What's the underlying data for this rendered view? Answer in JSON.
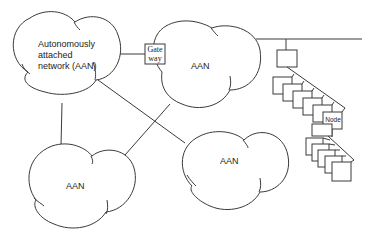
{
  "diagram": {
    "type": "network-topology",
    "networks": [
      {
        "id": "aan-main",
        "label_lines": [
          "Autonomously",
          "attached",
          "network (AAN)"
        ]
      },
      {
        "id": "aan-top-right",
        "label": "AAN"
      },
      {
        "id": "aan-bottom-left",
        "label": "AAN"
      },
      {
        "id": "aan-bottom-right",
        "label": "AAN"
      }
    ],
    "gateway": {
      "label_lines": [
        "Gate",
        "way"
      ]
    },
    "node_chain": {
      "label": "Node",
      "upper_group_count": 6,
      "lower_group_count": 5
    },
    "colors": {
      "line": "#3a3a3a",
      "background": "#ffffff",
      "text": "#222222"
    }
  }
}
